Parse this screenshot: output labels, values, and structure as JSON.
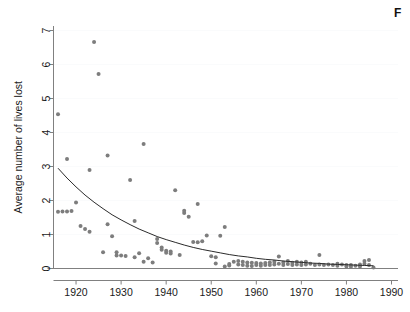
{
  "figure": {
    "caption_fragment": "F",
    "background_color": "#ffffff"
  },
  "chart_data": {
    "type": "scatter",
    "title": "",
    "subtitle": "",
    "xlabel": "",
    "ylabel": "Average number of lives lost",
    "xlim": [
      1915,
      1992
    ],
    "ylim": [
      0,
      7.3
    ],
    "xticks": [
      1920,
      1930,
      1940,
      1950,
      1960,
      1970,
      1980,
      1990
    ],
    "xtick_labels": [
      "1920",
      "1930",
      "1940",
      "1950",
      "1960",
      "1970",
      "1980",
      "1990"
    ],
    "yticks": [
      0,
      1,
      2,
      3,
      4,
      5,
      6,
      7
    ],
    "ytick_labels": [
      "0",
      "1",
      "2",
      "3",
      "4",
      "5",
      "6",
      "7"
    ],
    "grid": "horizontal-faint",
    "legend": "none",
    "legend_position": "none",
    "point_color": "#7d7d7d",
    "point_radius": 2.0,
    "curve_color": "#2b2b2b",
    "series": [
      {
        "name": "Average number of lives lost",
        "marker": "circle",
        "x": [
          1916,
          1916,
          1917,
          1918,
          1918,
          1919,
          1920,
          1921,
          1922,
          1923,
          1923,
          1924,
          1925,
          1926,
          1927,
          1927,
          1928,
          1929,
          1929,
          1930,
          1931,
          1932,
          1933,
          1933,
          1934,
          1935,
          1935,
          1936,
          1937,
          1938,
          1938,
          1939,
          1939,
          1940,
          1940,
          1941,
          1941,
          1942,
          1943,
          1944,
          1944,
          1945,
          1946,
          1947,
          1947,
          1948,
          1949,
          1950,
          1951,
          1951,
          1952,
          1953,
          1953,
          1954,
          1954,
          1955,
          1956,
          1956,
          1957,
          1957,
          1958,
          1958,
          1959,
          1959,
          1960,
          1960,
          1961,
          1961,
          1962,
          1962,
          1963,
          1963,
          1964,
          1964,
          1965,
          1965,
          1966,
          1966,
          1967,
          1967,
          1968,
          1968,
          1969,
          1969,
          1970,
          1970,
          1971,
          1971,
          1972,
          1973,
          1974,
          1974,
          1975,
          1976,
          1977,
          1978,
          1978,
          1979,
          1980,
          1980,
          1981,
          1981,
          1982,
          1983,
          1983,
          1984,
          1984,
          1985,
          1985,
          1986
        ],
        "y": [
          1.67,
          4.54,
          1.68,
          3.22,
          1.68,
          1.69,
          1.94,
          1.25,
          1.16,
          1.08,
          2.9,
          6.66,
          5.72,
          0.48,
          1.3,
          3.32,
          0.95,
          0.48,
          0.38,
          0.38,
          0.37,
          2.6,
          1.4,
          0.33,
          0.45,
          0.2,
          3.66,
          0.3,
          0.18,
          0.87,
          0.75,
          0.62,
          0.55,
          0.52,
          0.46,
          0.5,
          0.44,
          2.3,
          0.4,
          1.63,
          1.7,
          1.52,
          0.78,
          1.9,
          0.77,
          0.8,
          0.97,
          0.36,
          0.15,
          0.33,
          0.96,
          1.22,
          0.06,
          0.13,
          0.09,
          0.2,
          0.22,
          0.12,
          0.2,
          0.1,
          0.18,
          0.08,
          0.17,
          0.07,
          0.16,
          0.1,
          0.15,
          0.08,
          0.16,
          0.1,
          0.18,
          0.1,
          0.2,
          0.12,
          0.35,
          0.14,
          0.18,
          0.1,
          0.22,
          0.13,
          0.17,
          0.1,
          0.2,
          0.12,
          0.18,
          0.1,
          0.2,
          0.12,
          0.14,
          0.1,
          0.4,
          0.12,
          0.1,
          0.12,
          0.1,
          0.14,
          0.08,
          0.12,
          0.1,
          0.06,
          0.1,
          0.05,
          0.08,
          0.12,
          0.06,
          0.22,
          0.14,
          0.25,
          0.1,
          0.03
        ]
      }
    ],
    "fit_curve": {
      "name": "exponential decay fit",
      "x": [
        1916,
        1918,
        1920,
        1922,
        1924,
        1926,
        1928,
        1930,
        1932,
        1934,
        1936,
        1938,
        1940,
        1942,
        1944,
        1946,
        1948,
        1950,
        1952,
        1954,
        1956,
        1958,
        1960,
        1962,
        1964,
        1966,
        1968,
        1970,
        1972,
        1974,
        1976,
        1978,
        1980,
        1982,
        1984,
        1986
      ],
      "y": [
        2.95,
        2.66,
        2.4,
        2.16,
        1.95,
        1.76,
        1.58,
        1.43,
        1.29,
        1.16,
        1.05,
        0.94,
        0.85,
        0.77,
        0.69,
        0.62,
        0.56,
        0.51,
        0.46,
        0.41,
        0.37,
        0.34,
        0.3,
        0.27,
        0.25,
        0.22,
        0.2,
        0.18,
        0.16,
        0.15,
        0.13,
        0.12,
        0.11,
        0.1,
        0.09,
        0.08
      ]
    }
  }
}
